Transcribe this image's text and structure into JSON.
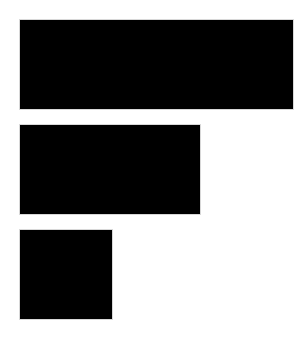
{
  "chart_data": {
    "type": "bar",
    "orientation": "horizontal",
    "title": "",
    "xlabel": "",
    "ylabel": "",
    "categories": [
      "",
      "",
      ""
    ],
    "values": [
      3,
      2,
      1
    ],
    "xlim": [
      0,
      3
    ],
    "grid": false,
    "legend": null,
    "bar_color": "#000000",
    "bars": [
      {
        "value": 3,
        "top": 20,
        "width": 273
      },
      {
        "value": 2,
        "top": 125,
        "width": 180
      },
      {
        "value": 1,
        "top": 230,
        "width": 92
      }
    ]
  },
  "colors": {
    "background": "#ffffff",
    "bar": "#000000"
  }
}
